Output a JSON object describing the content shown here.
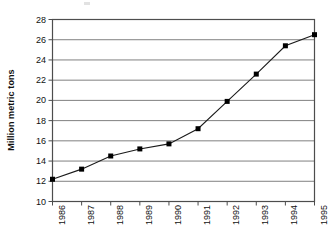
{
  "chart_data": {
    "type": "line",
    "title": "",
    "xlabel": "",
    "ylabel": "Million metric tons",
    "categories": [
      "1986",
      "1987",
      "1988",
      "1989",
      "1990",
      "1991",
      "1992",
      "1993",
      "1994",
      "1995"
    ],
    "values": [
      12.2,
      13.2,
      14.5,
      15.2,
      15.7,
      17.2,
      19.9,
      22.6,
      25.4,
      26.5
    ],
    "series": [
      {
        "name": "Million metric tons",
        "values": [
          12.2,
          13.2,
          14.5,
          15.2,
          15.7,
          17.2,
          19.9,
          22.6,
          25.4,
          26.5
        ]
      }
    ],
    "ylim": [
      10,
      28
    ],
    "ytick_labels": [
      "10",
      "12",
      "14",
      "16",
      "18",
      "20",
      "22",
      "24",
      "26",
      "28"
    ],
    "ytick_values": [
      10,
      12,
      14,
      16,
      18,
      20,
      22,
      24,
      26,
      28
    ],
    "xtick_labels": [
      "1986",
      "1987",
      "1988",
      "1989",
      "1990",
      "1991",
      "1992",
      "1993",
      "1994",
      "1995"
    ],
    "grid": "horizontal",
    "legend": "none",
    "marker": "filled-square",
    "colors": {
      "line": "#1a1a1a",
      "marker": "#000000",
      "gridline": "#808080",
      "axis": "#4d4d4d",
      "text": "#111111",
      "background": "#ffffff"
    }
  }
}
